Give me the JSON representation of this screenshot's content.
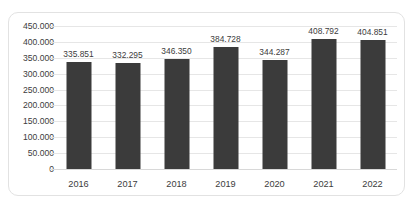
{
  "chart_data": {
    "type": "bar",
    "title": "",
    "subtitle": "",
    "xlabel": "",
    "ylabel": "",
    "categories": [
      "2016",
      "2017",
      "2018",
      "2019",
      "2020",
      "2021",
      "2022"
    ],
    "values": [
      335851,
      332295,
      346350,
      384728,
      344287,
      408792,
      404851
    ],
    "data_labels": [
      "335.851",
      "332.295",
      "346.350",
      "384.728",
      "344.287",
      "408.792",
      "404.851"
    ],
    "ylim": [
      0,
      450000
    ],
    "ytick_values": [
      0,
      50000,
      100000,
      150000,
      200000,
      250000,
      300000,
      350000,
      400000,
      450000
    ],
    "ytick_labels": [
      "0",
      "50.000",
      "100.000",
      "150.000",
      "200.000",
      "250.000",
      "300.000",
      "350.000",
      "400.000",
      "450.000"
    ],
    "grid": true,
    "legend": false,
    "legend_position": "none",
    "series": [
      {
        "name": "",
        "values": [
          335851,
          332295,
          346350,
          384728,
          344287,
          408792,
          404851
        ]
      }
    ]
  },
  "style": {
    "bar_color": "#3b3b3b",
    "grid_color": "#e6e6e6",
    "text_color": "#3c3c3c",
    "frame_color": "#e2e2e2",
    "background": "#ffffff"
  }
}
